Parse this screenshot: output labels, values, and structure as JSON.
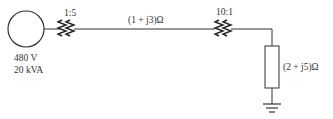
{
  "diagram": {
    "type": "one-line power system diagram",
    "source": {
      "voltage": "480 V",
      "rating": "20 kVA"
    },
    "transformer1": {
      "ratio": "1:5"
    },
    "line": {
      "impedance": "(1 + j3)Ω"
    },
    "transformer2": {
      "ratio": "10:1"
    },
    "load": {
      "impedance": "(2 + j5)Ω"
    }
  }
}
